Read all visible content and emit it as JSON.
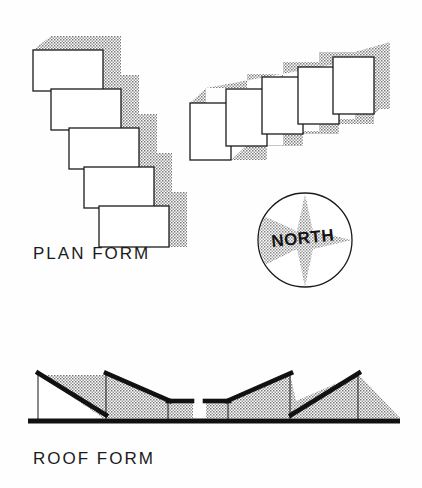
{
  "figure": {
    "background_color": "#fefefe",
    "ink_color": "#1b1b1b",
    "stipple_color": "#8a8a8a"
  },
  "labels": {
    "plan_form": "PLAN FORM",
    "roof_form": "ROOF FORM",
    "north": "NORTH"
  },
  "plan_form_diagram": {
    "name": "plan-form-blocks",
    "description": "Five horizontal rectangles stepping down and to the right with drop shadow",
    "block_count": 5,
    "blocks": [
      {
        "x": 33,
        "y": 50,
        "w": 70,
        "h": 41
      },
      {
        "x": 51,
        "y": 89,
        "w": 70,
        "h": 41
      },
      {
        "x": 69,
        "y": 128,
        "w": 70,
        "h": 41
      },
      {
        "x": 84,
        "y": 167,
        "w": 70,
        "h": 41
      },
      {
        "x": 99,
        "y": 206,
        "w": 70,
        "h": 41
      }
    ],
    "shadow_offset_x": 18,
    "shadow_offset_y": -14
  },
  "roof_plan_diagram": {
    "name": "roof-plan-blocks",
    "description": "Five vertical rectangles ascending diagonally to the upper right with drop shadow",
    "block_count": 5,
    "blocks": [
      {
        "x": 190,
        "y": 103,
        "w": 41,
        "h": 57
      },
      {
        "x": 226,
        "y": 89,
        "w": 41,
        "h": 57
      },
      {
        "x": 262,
        "y": 77,
        "w": 41,
        "h": 57
      },
      {
        "x": 298,
        "y": 67,
        "w": 41,
        "h": 57
      },
      {
        "x": 333,
        "y": 57,
        "w": 41,
        "h": 57
      }
    ],
    "shadow_offset_x": 16,
    "shadow_offset_y": -15
  },
  "compass": {
    "name": "north-compass",
    "center_x": 305,
    "center_y": 240,
    "radius": 47,
    "star_points": 4,
    "label": "NORTH"
  },
  "roof_form_diagram": {
    "name": "roof-section",
    "description": "Mirror symmetric sawtooth roof section with thick black roof lines and stippled fill above a ground line",
    "ground_line": {
      "x1": 28,
      "x2": 400,
      "y": 420,
      "thickness": 5
    },
    "left_half": {
      "peaks": [
        {
          "x": 38,
          "y": 372
        },
        {
          "x": 106,
          "y": 372
        }
      ],
      "eave_drop_x": [
        100,
        168
      ],
      "flat_roof": {
        "x1": 168,
        "x2": 190,
        "y": 401
      },
      "posts_x": [
        38,
        106,
        168
      ]
    },
    "right_half": {
      "peaks": [
        {
          "x": 290,
          "y": 372
        },
        {
          "x": 358,
          "y": 372
        }
      ],
      "flat_roof": {
        "x1": 206,
        "x2": 228,
        "y": 401
      },
      "posts_x": [
        228,
        290,
        358
      ]
    },
    "gap": {
      "x1": 190,
      "x2": 206
    }
  }
}
